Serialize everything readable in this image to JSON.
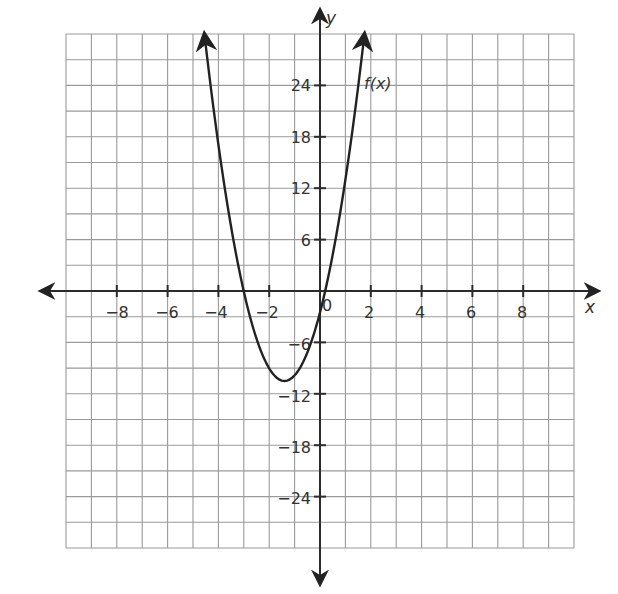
{
  "chart_data": {
    "type": "line",
    "title": "",
    "xlabel": "x",
    "ylabel": "y",
    "xlim": [
      -10,
      10
    ],
    "ylim": [
      -30,
      30
    ],
    "grid": true,
    "grid_step": {
      "x": 1,
      "y": 3
    },
    "x_ticks": [
      -8,
      -6,
      -4,
      -2,
      2,
      4,
      6,
      8
    ],
    "y_ticks": [
      -24,
      -18,
      -12,
      -6,
      6,
      12,
      18,
      24
    ],
    "origin_label": "0",
    "series": [
      {
        "name": "f(x)",
        "label": "f(x)",
        "kind": "parabola",
        "vertex": [
          -1.4,
          -10.5
        ],
        "x_intercepts": [
          -3,
          0.2
        ],
        "y_intercept": -2.5,
        "approx_equation": "f(x) ≈ 4.08(x + 1.4)^2 − 10.5",
        "x_range": [
          -4.55,
          1.75
        ],
        "ends_with_arrows": true,
        "points": [
          [
            -4.55,
            30
          ],
          [
            -4.0,
            18
          ],
          [
            -3.5,
            7.5
          ],
          [
            -3.0,
            0
          ],
          [
            -2.5,
            -5.6
          ],
          [
            -2.0,
            -9.0
          ],
          [
            -1.4,
            -10.5
          ],
          [
            -1.0,
            -9.8
          ],
          [
            -0.5,
            -7.1
          ],
          [
            0,
            -2.5
          ],
          [
            0.2,
            0
          ],
          [
            0.6,
            6
          ],
          [
            1.0,
            13
          ],
          [
            1.25,
            18
          ],
          [
            1.75,
            30
          ]
        ]
      }
    ],
    "legend": {
      "position": "inline label near upper-right branch",
      "entries": [
        "f(x)"
      ]
    }
  },
  "labels": {
    "x_axis": "x",
    "y_axis": "y",
    "function": "f(x)",
    "origin": "0",
    "x_ticks": [
      "−8",
      "−6",
      "−4",
      "−2",
      "2",
      "4",
      "6",
      "8"
    ],
    "y_ticks_pos": [
      "24",
      "18",
      "12",
      "6"
    ],
    "y_ticks_neg": [
      "−6",
      "−12",
      "−18",
      "−24"
    ]
  },
  "colors": {
    "grid": "#9a9a9a",
    "axis": "#2b2b2b",
    "curve": "#222222",
    "text": "#333333"
  }
}
